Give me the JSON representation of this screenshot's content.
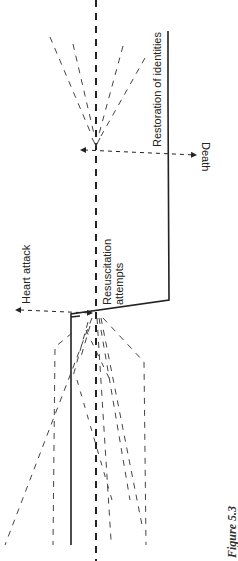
{
  "figure": {
    "caption": "Figure 5.3",
    "labels": {
      "restoration": "Restoration of identities",
      "death": "Death",
      "heart_attack": "Heart attack",
      "resuscitation_line1": "Resuscitation",
      "resuscitation_line2": "attempts"
    },
    "colors": {
      "line": "#222222",
      "dashed": "#333333",
      "background": "#ffffff"
    }
  }
}
